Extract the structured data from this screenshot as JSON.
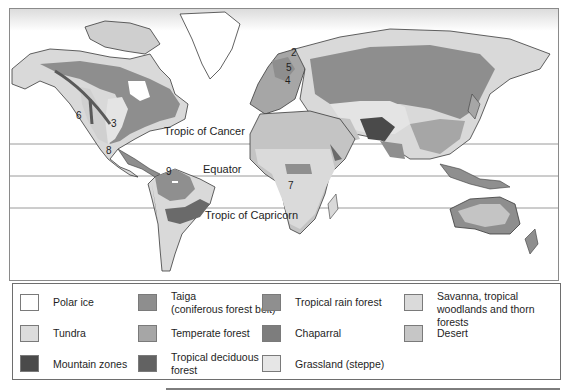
{
  "map": {
    "latitude_lines": [
      {
        "label": "Tropic of Cancer",
        "y": 135
      },
      {
        "label": "Equator",
        "y": 167
      },
      {
        "label": "Tropic of Capricorn",
        "y": 199
      }
    ],
    "region_numbers": [
      "6",
      "3",
      "8",
      "9",
      "7",
      "2",
      "5",
      "4"
    ],
    "colors": {
      "ocean": "#ffffff",
      "polar_ice": "#ffffff",
      "tundra": "#d9d9d9",
      "taiga": "#8e8e8e",
      "temperate_forest": "#a6a6a6",
      "tropical_rain_forest": "#8f8f8f",
      "chaparral": "#7d7d7d",
      "mountain": "#4a4a4a",
      "tropical_deciduous": "#6a6a6a",
      "grassland": "#e4e4e4",
      "savanna": "#dadada",
      "desert": "#c4c4c4",
      "coast": "#3a3a3a"
    }
  },
  "legend": {
    "items": [
      {
        "label": "Polar ice",
        "color": "#ffffff"
      },
      {
        "label": "Taiga (coniferous forest belt)",
        "line1": "Taiga",
        "line2": "(coniferous forest belt)",
        "color": "#8e8e8e"
      },
      {
        "label": "Tropical rain forest",
        "color": "#8f8f8f"
      },
      {
        "label": "Savanna, tropical woodlands and thorn forests",
        "line1": "Savanna, tropical",
        "line2": "woodlands and thorn forests",
        "color": "#dadada"
      },
      {
        "label": "Tundra",
        "color": "#dcdcdc"
      },
      {
        "label": "Temperate forest",
        "color": "#a6a6a6"
      },
      {
        "label": "Chaparral",
        "color": "#7d7d7d"
      },
      {
        "label": "Desert",
        "color": "#c6c6c6"
      },
      {
        "label": "Mountain zones",
        "color": "#4a4a4a"
      },
      {
        "label": "Tropical deciduous forest",
        "line1": "Tropical deciduous",
        "line2": "forest",
        "color": "#626262"
      },
      {
        "label": "Grassland (steppe)",
        "color": "#e6e6e6"
      }
    ]
  }
}
